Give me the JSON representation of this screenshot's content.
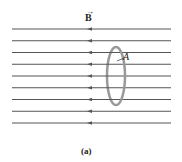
{
  "field_label": "B",
  "field_vector_mark": "⃗",
  "area_label": "A",
  "caption": "(a)",
  "field_line_count": 9,
  "field_direction": "left",
  "colors": {
    "field_line": "#555555",
    "loop": "#999999",
    "text": "#222222"
  }
}
